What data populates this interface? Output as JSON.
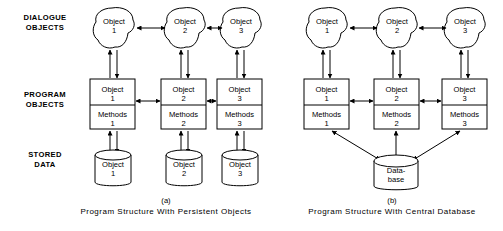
{
  "figure": {
    "background_color": "#ffffff",
    "line_color": "#000000",
    "width": 503,
    "height": 231
  },
  "row_labels": [
    {
      "line1": "DIALOGUE",
      "line2": "OBJECTS"
    },
    {
      "line1": "PROGRAM",
      "line2": "OBJECTS"
    },
    {
      "line1": "STORED",
      "line2": "DATA"
    }
  ],
  "panels": [
    {
      "id": "panel-a",
      "letter": "(a)",
      "caption": "Program Structure With Persistent Objects",
      "dialogue_objects": [
        {
          "line1": "Object",
          "line2": "1"
        },
        {
          "line1": "Object",
          "line2": "2"
        },
        {
          "line1": "Object",
          "line2": "3"
        }
      ],
      "program_objects": [
        {
          "top_line1": "Object",
          "top_line2": "1",
          "bottom_line1": "Methods",
          "bottom_line2": "1"
        },
        {
          "top_line1": "Object",
          "top_line2": "2",
          "bottom_line1": "Methods",
          "bottom_line2": "2"
        },
        {
          "top_line1": "Object",
          "top_line2": "3",
          "bottom_line1": "Methods",
          "bottom_line2": "3"
        }
      ],
      "stored_data": [
        {
          "line1": "Object",
          "line2": "1"
        },
        {
          "line1": "Object",
          "line2": "2"
        },
        {
          "line1": "Object",
          "line2": "3"
        }
      ]
    },
    {
      "id": "panel-b",
      "letter": "(b)",
      "caption": "Program Structure With Central Database",
      "dialogue_objects": [
        {
          "line1": "Object",
          "line2": "1"
        },
        {
          "line1": "Object",
          "line2": "2"
        },
        {
          "line1": "Object",
          "line2": "3"
        }
      ],
      "program_objects": [
        {
          "top_line1": "Object",
          "top_line2": "1",
          "bottom_line1": "Methods",
          "bottom_line2": "1"
        },
        {
          "top_line1": "Object",
          "top_line2": "2",
          "bottom_line1": "Methods",
          "bottom_line2": "2"
        },
        {
          "top_line1": "Object",
          "top_line2": "3",
          "bottom_line1": "Methods",
          "bottom_line2": "3"
        }
      ],
      "stored_data": [
        {
          "line1": "Data-",
          "line2": "base"
        }
      ]
    }
  ]
}
